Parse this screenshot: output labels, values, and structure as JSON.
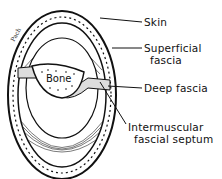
{
  "figure": {
    "labels": {
      "skin": "Skin",
      "superficial_fascia_1": "Superficial",
      "superficial_fascia_2": "fascia",
      "deep_fascia": "Deep fascia",
      "septum_1": "Intermuscular",
      "septum_2": "fascial septum",
      "bone": "Bone"
    },
    "colors": {
      "ink": "#111111",
      "background": "#ffffff"
    }
  }
}
